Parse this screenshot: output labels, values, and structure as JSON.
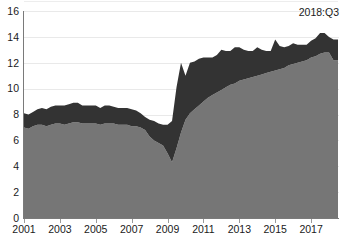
{
  "chart_data": {
    "type": "area",
    "stacked": true,
    "title": "",
    "subtitle": "",
    "xlabel": "",
    "ylabel": "",
    "ylim": [
      0,
      16
    ],
    "ytick_values": [
      0,
      2,
      4,
      6,
      8,
      10,
      12,
      14,
      16
    ],
    "ytick_labels": [
      "0",
      "2",
      "4",
      "6",
      "8",
      "10",
      "12",
      "14",
      "16"
    ],
    "xtick_labels": [
      "2001",
      "2003",
      "2005",
      "2007",
      "2009",
      "2011",
      "2013",
      "2015",
      "2017"
    ],
    "xtick_values": [
      2001,
      2003,
      2005,
      2007,
      2009,
      2011,
      2013,
      2015,
      2017
    ],
    "xlim": [
      2001,
      2018.5
    ],
    "grid": true,
    "grid_axis": "y",
    "legend": false,
    "legend_position": "none",
    "annotations": [
      {
        "text": "2018:Q3",
        "x": 2018.5,
        "y": 15.6,
        "align": "right"
      }
    ],
    "colors": {
      "series_lower": "#767676",
      "series_upper": "#333333",
      "gridline": "#e9e9e9",
      "axis": "#7a7a7a",
      "text": "#1a1a1a",
      "background": "#ffffff"
    },
    "x": [
      "2001:Q1",
      "2001:Q2",
      "2001:Q3",
      "2001:Q4",
      "2002:Q1",
      "2002:Q2",
      "2002:Q3",
      "2002:Q4",
      "2003:Q1",
      "2003:Q2",
      "2003:Q3",
      "2003:Q4",
      "2004:Q1",
      "2004:Q2",
      "2004:Q3",
      "2004:Q4",
      "2005:Q1",
      "2005:Q2",
      "2005:Q3",
      "2005:Q4",
      "2006:Q1",
      "2006:Q2",
      "2006:Q3",
      "2006:Q4",
      "2007:Q1",
      "2007:Q2",
      "2007:Q3",
      "2007:Q4",
      "2008:Q1",
      "2008:Q2",
      "2008:Q3",
      "2008:Q4",
      "2009:Q1",
      "2009:Q2",
      "2009:Q3",
      "2009:Q4",
      "2010:Q1",
      "2010:Q2",
      "2010:Q3",
      "2010:Q4",
      "2011:Q1",
      "2011:Q2",
      "2011:Q3",
      "2011:Q4",
      "2012:Q1",
      "2012:Q2",
      "2012:Q3",
      "2012:Q4",
      "2013:Q1",
      "2013:Q2",
      "2013:Q3",
      "2013:Q4",
      "2014:Q1",
      "2014:Q2",
      "2014:Q3",
      "2014:Q4",
      "2015:Q1",
      "2015:Q2",
      "2015:Q3",
      "2015:Q4",
      "2016:Q1",
      "2016:Q2",
      "2016:Q3",
      "2016:Q4",
      "2017:Q1",
      "2017:Q2",
      "2017:Q3",
      "2017:Q4",
      "2018:Q1",
      "2018:Q2",
      "2018:Q3"
    ],
    "series": [
      {
        "name": "lower",
        "color": "#767676",
        "values": [
          7.0,
          6.9,
          7.1,
          7.2,
          7.2,
          7.1,
          7.2,
          7.3,
          7.3,
          7.2,
          7.3,
          7.4,
          7.4,
          7.3,
          7.3,
          7.3,
          7.3,
          7.2,
          7.3,
          7.3,
          7.3,
          7.2,
          7.2,
          7.2,
          7.1,
          7.1,
          7.0,
          6.8,
          6.3,
          6.0,
          5.8,
          5.6,
          5.0,
          4.3,
          5.4,
          6.6,
          7.6,
          8.1,
          8.4,
          8.7,
          9.0,
          9.3,
          9.5,
          9.7,
          9.9,
          10.1,
          10.3,
          10.4,
          10.6,
          10.7,
          10.8,
          10.9,
          11.0,
          11.1,
          11.2,
          11.3,
          11.4,
          11.5,
          11.6,
          11.8,
          11.9,
          12.0,
          12.1,
          12.2,
          12.4,
          12.5,
          12.7,
          12.8,
          12.8,
          12.2,
          12.2
        ]
      },
      {
        "name": "upper",
        "color": "#333333",
        "values": [
          1.1,
          1.1,
          1.1,
          1.2,
          1.3,
          1.3,
          1.4,
          1.4,
          1.4,
          1.5,
          1.5,
          1.5,
          1.5,
          1.4,
          1.4,
          1.4,
          1.4,
          1.3,
          1.4,
          1.4,
          1.3,
          1.3,
          1.3,
          1.3,
          1.3,
          1.2,
          1.1,
          1.0,
          1.3,
          1.5,
          1.5,
          1.6,
          2.2,
          3.2,
          4.7,
          5.4,
          3.4,
          3.9,
          3.7,
          3.6,
          3.4,
          3.1,
          2.9,
          2.9,
          3.1,
          2.8,
          2.6,
          2.8,
          2.6,
          2.3,
          2.1,
          2.0,
          2.2,
          1.9,
          1.7,
          1.6,
          2.4,
          1.8,
          1.6,
          1.5,
          1.6,
          1.4,
          1.3,
          1.2,
          1.3,
          1.4,
          1.6,
          1.5,
          1.2,
          1.6,
          1.6
        ]
      }
    ],
    "totals": [
      8.1,
      8.0,
      8.2,
      8.4,
      8.5,
      8.4,
      8.6,
      8.7,
      8.7,
      8.7,
      8.8,
      8.9,
      8.9,
      8.7,
      8.7,
      8.7,
      8.7,
      8.5,
      8.7,
      8.7,
      8.6,
      8.5,
      8.5,
      8.5,
      8.4,
      8.3,
      8.1,
      7.8,
      7.6,
      7.5,
      7.3,
      7.2,
      7.2,
      7.5,
      10.1,
      12.0,
      11.0,
      12.0,
      12.1,
      12.3,
      12.4,
      12.4,
      12.4,
      12.6,
      13.0,
      12.9,
      12.9,
      13.2,
      13.2,
      13.0,
      12.9,
      12.9,
      13.2,
      13.0,
      12.9,
      12.9,
      13.8,
      13.3,
      13.2,
      13.3,
      13.5,
      13.4,
      13.4,
      13.4,
      13.7,
      13.9,
      14.3,
      14.3,
      14.0,
      13.8,
      13.8
    ]
  }
}
